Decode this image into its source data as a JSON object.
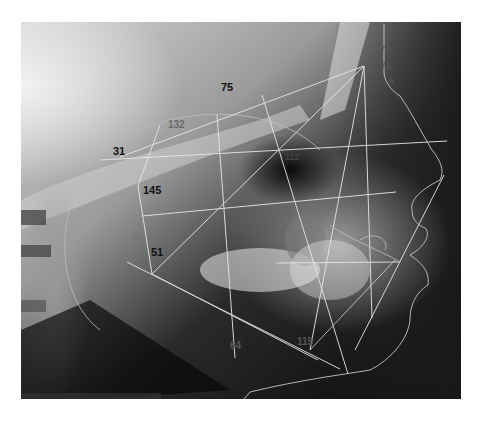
{
  "image": {
    "type": "cephalometric lateral radiograph with tracing",
    "frame": {
      "x": 21,
      "y": 22,
      "width": 440,
      "height": 377
    }
  },
  "labels": [
    {
      "id": "label-75",
      "text": "75",
      "x": 221,
      "y": 91,
      "color": "#111111",
      "size": 11
    },
    {
      "id": "label-132",
      "text": "132",
      "x": 168,
      "y": 128,
      "color": "#6a6a6a",
      "size": 10
    },
    {
      "id": "label-31",
      "text": "31",
      "x": 113,
      "y": 155,
      "color": "#111111",
      "size": 11
    },
    {
      "id": "label-145",
      "text": "145",
      "x": 143,
      "y": 194,
      "color": "#111111",
      "size": 11
    },
    {
      "id": "label-40",
      "text": "40",
      "x": 131,
      "y": 241,
      "color": "#777777",
      "size": 10
    },
    {
      "id": "label-51",
      "text": "51",
      "x": 151,
      "y": 256,
      "color": "#111111",
      "size": 11
    },
    {
      "id": "label-64",
      "text": "64",
      "x": 230,
      "y": 349,
      "color": "#555555",
      "size": 10
    },
    {
      "id": "label-115",
      "text": "115",
      "x": 297,
      "y": 345,
      "color": "#555555",
      "size": 10
    },
    {
      "id": "label-center",
      "text": "112",
      "x": 285,
      "y": 160,
      "color": "#444444",
      "size": 9
    },
    {
      "id": "label-77",
      "text": "77",
      "x": 380,
      "y": 52,
      "color": "#555555",
      "size": 9
    },
    {
      "id": "label-71",
      "text": "71",
      "x": 381,
      "y": 68,
      "color": "#555555",
      "size": 9
    },
    {
      "id": "label-6",
      "text": "6",
      "x": 389,
      "y": 84,
      "color": "#555555",
      "size": 9
    }
  ],
  "colors": {
    "tracing": "#e8e8e8",
    "background": "#ffffff",
    "xray_light": "#d6d6d6",
    "xray_dark": "#0a0a0a"
  }
}
